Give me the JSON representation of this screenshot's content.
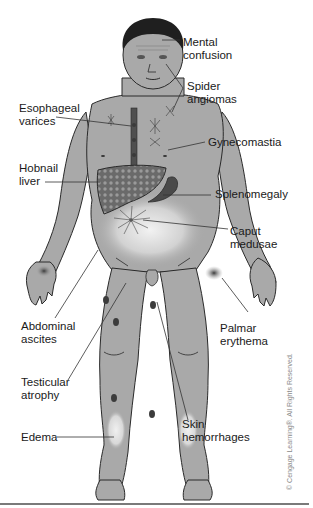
{
  "figure": {
    "colors": {
      "skin": "#a9a9a9",
      "outline": "#2a2a2a",
      "hair": "#1f1f1f",
      "liver": "#6e6e6e",
      "spleen": "#4a4a4a",
      "lesion": "#3c3c3c",
      "leader_line": "#333333",
      "highlight": "#e6e6e6"
    }
  },
  "labels": [
    {
      "id": "mental-confusion",
      "text": "Mental\nconfusion"
    },
    {
      "id": "spider-angiomas",
      "text": "Spider\nangiomas"
    },
    {
      "id": "esophageal-varices",
      "text": "Esophageal\nvarices"
    },
    {
      "id": "gynecomastia",
      "text": "Gynecomastia"
    },
    {
      "id": "hobnail-liver",
      "text": "Hobnail\nliver"
    },
    {
      "id": "splenomegaly",
      "text": "Splenomegaly"
    },
    {
      "id": "caput-medusae",
      "text": "Caput\nmedusae"
    },
    {
      "id": "abdominal-ascites",
      "text": "Abdominal\nascites"
    },
    {
      "id": "palmar-erythema",
      "text": "Palmar\nerythema"
    },
    {
      "id": "testicular-atrophy",
      "text": "Testicular\natrophy"
    },
    {
      "id": "skin-hemorrhages",
      "text": "Skin\nhemorrhages"
    },
    {
      "id": "edema",
      "text": "Edema"
    }
  ],
  "copyright": "© Cengage Learning®. All Rights Reserved."
}
